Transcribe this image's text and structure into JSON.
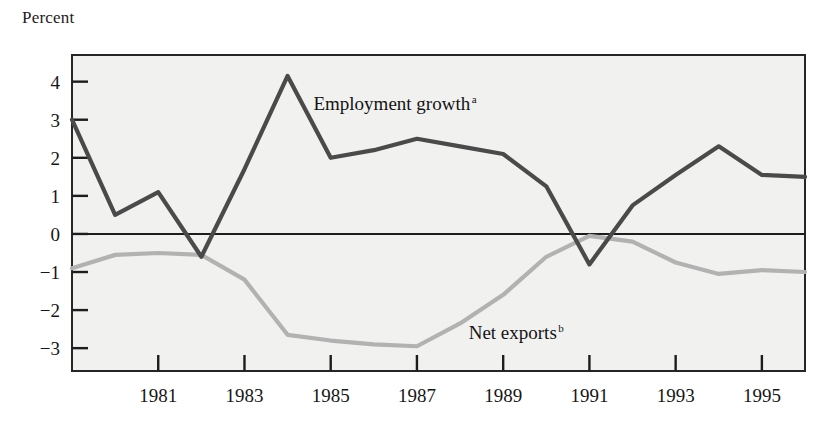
{
  "figure": {
    "axis_title": "Percent",
    "background_color": "#f1f1f0",
    "frame_color": "#262626",
    "page_background": "#ffffff"
  },
  "chart_data": {
    "type": "line",
    "title": "",
    "subtitle": "",
    "xlabel": "",
    "ylabel": "Percent",
    "grid": false,
    "legend_position": "inline-annotation",
    "xlim": [
      1979,
      1996
    ],
    "ylim": [
      -3.6,
      4.7
    ],
    "yticks": [
      4,
      3,
      2,
      1,
      0,
      -1,
      -2,
      -3
    ],
    "ytick_labels": [
      "4",
      "3",
      "2",
      "1",
      "0",
      "−1",
      "−2",
      "−3"
    ],
    "xticks": [
      1981,
      1983,
      1985,
      1987,
      1989,
      1991,
      1993,
      1995
    ],
    "xtick_labels": [
      "1981",
      "1983",
      "1985",
      "1987",
      "1989",
      "1991",
      "1993",
      "1995"
    ],
    "zero_line": 0,
    "x": [
      1979,
      1980,
      1981,
      1982,
      1983,
      1984,
      1985,
      1986,
      1987,
      1988,
      1989,
      1990,
      1991,
      1992,
      1993,
      1994,
      1995,
      1996
    ],
    "series": [
      {
        "name": "Employment growth",
        "footnote": "a",
        "color": "#4a4a4a",
        "width": 4.2,
        "label_x": 1984.6,
        "label_y": 3.25,
        "values": [
          3.0,
          0.5,
          1.1,
          -0.6,
          1.7,
          4.15,
          2.0,
          2.2,
          2.5,
          2.3,
          2.1,
          1.25,
          -0.8,
          0.75,
          1.55,
          2.3,
          1.55,
          1.5
        ]
      },
      {
        "name": "Net exports",
        "footnote": "b",
        "color": "#b2b2b2",
        "width": 4.2,
        "label_x": 1988.2,
        "label_y": -2.75,
        "values": [
          -0.9,
          -0.55,
          -0.5,
          -0.55,
          -1.2,
          -2.65,
          -2.8,
          -2.9,
          -2.95,
          -2.35,
          -1.6,
          -0.6,
          -0.05,
          -0.2,
          -0.75,
          -1.05,
          -0.95,
          -1.0
        ]
      }
    ]
  }
}
